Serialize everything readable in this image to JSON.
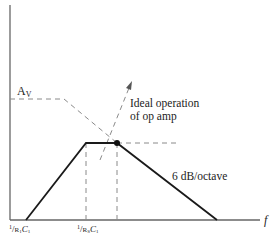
{
  "diagram": {
    "labels": {
      "gain": "A",
      "gain_sub": "V",
      "ideal_line1": "Ideal operation",
      "ideal_line2": "of op amp",
      "slope": "6 dB/octave",
      "x_axis": "f",
      "tick1_num": "1",
      "tick1_den": "R",
      "tick1_den_sub": "1",
      "tick1_c": "C",
      "tick1_c_sub": "1",
      "tick2_num": "1",
      "tick2_den": "R",
      "tick2_den_sub": "S",
      "tick2_c": "C",
      "tick2_c_sub": "1"
    },
    "colors": {
      "solid": "#1a1a1a",
      "dashed": "#8a8a8a",
      "axis": "#555555"
    }
  }
}
